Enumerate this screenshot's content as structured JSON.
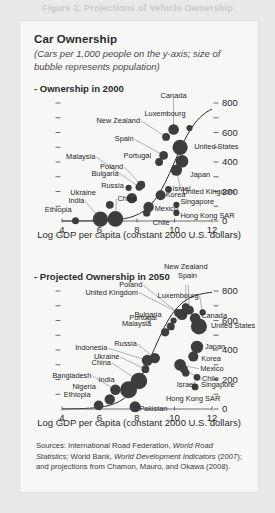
{
  "top_banner": "Figure 2.  Projections of Vehicle Ownership",
  "card": {
    "title": "Car Ownership",
    "subtitle": "(Cars per 1,000 people on the y-axis; size of bubble represents population)"
  },
  "sources": {
    "prefix": "Sources: International Road Federation, ",
    "italic1": "World Road Statistics;",
    "mid": " World Bank, ",
    "italic2": "World Development Indicators",
    "mid2": " (2007); and",
    "line3": "projections from Chamon, Mauro, and Okawa (2008)."
  },
  "chart_data": [
    {
      "type": "scatter",
      "title": "- Ownership in 2000",
      "panel_label": "Ownership in 2000",
      "xlabel": "Log GDP per capita (constant 2000 U.S. dollars)",
      "ylabel": "Cars per 1,000 people",
      "xlim": [
        4,
        12
      ],
      "ylim": [
        0,
        800
      ],
      "xticks": [
        4,
        6,
        8,
        10,
        12
      ],
      "yticks": [
        0,
        200,
        400,
        600,
        800
      ],
      "yticks_minor": [
        100,
        300,
        500,
        700
      ],
      "grid": false,
      "y_axis_side": "right",
      "points": [
        {
          "name": "Ethiopia",
          "x": 4.72,
          "y": 2,
          "pop": 6.5,
          "lx": -4,
          "ly": -11,
          "align": "r"
        },
        {
          "name": "India",
          "x": 6.05,
          "y": 12,
          "pop": 30,
          "lx": -16,
          "ly": -18,
          "align": "r"
        },
        {
          "name": "China",
          "x": 6.85,
          "y": 14,
          "pop": 32,
          "lx": 2,
          "ly": -20,
          "align": "l"
        },
        {
          "name": "Ukraine",
          "x": 6.55,
          "y": 110,
          "pop": 8,
          "lx": -14,
          "ly": -12,
          "align": "r"
        },
        {
          "name": "Bulgaria",
          "x": 7.55,
          "y": 225,
          "pop": 5,
          "lx": -10,
          "ly": -14,
          "align": "r"
        },
        {
          "name": "Russia",
          "x": 7.72,
          "y": 155,
          "pop": 14,
          "lx": -8,
          "ly": -12,
          "align": "r"
        },
        {
          "name": "Malaysia",
          "x": 8.12,
          "y": 230,
          "pop": 7,
          "lx": -44,
          "ly": -30,
          "align": "r"
        },
        {
          "name": "Poland",
          "x": 8.22,
          "y": 245,
          "pop": 9,
          "lx": -18,
          "ly": -18,
          "align": "r"
        },
        {
          "name": "Mexico",
          "x": 8.62,
          "y": 95,
          "pop": 14,
          "lx": 6,
          "ly": 2,
          "align": "l"
        },
        {
          "name": "Chile",
          "x": 8.52,
          "y": 55,
          "pop": 7,
          "lx": 6,
          "ly": 10,
          "align": "l"
        },
        {
          "name": "Korea",
          "x": 9.26,
          "y": 175,
          "pop": 13,
          "lx": 5,
          "ly": 0,
          "align": "l"
        },
        {
          "name": "Israel",
          "x": 9.68,
          "y": 215,
          "pop": 6,
          "lx": 4,
          "ly": 0,
          "align": "l"
        },
        {
          "name": "Singapore",
          "x": 10.1,
          "y": 110,
          "pop": 5,
          "lx": 4,
          "ly": -3,
          "align": "l"
        },
        {
          "name": "Hong Kong SAR",
          "x": 10.1,
          "y": 55,
          "pop": 5,
          "lx": 4,
          "ly": 3,
          "align": "l"
        },
        {
          "name": "Portugal",
          "x": 9.18,
          "y": 400,
          "pop": 8,
          "lx": -8,
          "ly": -6,
          "align": "r"
        },
        {
          "name": "Spain",
          "x": 9.42,
          "y": 445,
          "pop": 10,
          "lx": -30,
          "ly": -16,
          "align": "r"
        },
        {
          "name": "New Zealand",
          "x": 9.55,
          "y": 570,
          "pop": 8,
          "lx": -26,
          "ly": -16,
          "align": "r"
        },
        {
          "name": "Canada",
          "x": 9.95,
          "y": 620,
          "pop": 15,
          "lx": 0,
          "ly": -34,
          "align": "c"
        },
        {
          "name": "Luxembourg",
          "x": 10.8,
          "y": 630,
          "pop": 5,
          "lx": -4,
          "ly": -14,
          "align": "r"
        },
        {
          "name": "United States",
          "x": 10.3,
          "y": 500,
          "pop": 30,
          "lx": 14,
          "ly": 0,
          "align": "l"
        },
        {
          "name": "Japan",
          "x": 10.4,
          "y": 405,
          "pop": 21,
          "lx": 8,
          "ly": 14,
          "align": "l"
        },
        {
          "name": "United Kingdom",
          "x": 10.1,
          "y": 345,
          "pop": 17,
          "lx": 6,
          "ly": 22,
          "align": "l"
        }
      ]
    },
    {
      "type": "scatter",
      "title": "- Projected Ownership in 2050",
      "panel_label": "Projected Ownership in 2050",
      "xlabel": "Log GDP per capita (constant 2000 U.S. dollars)",
      "ylabel": "Cars per 1,000 people",
      "xlim": [
        4,
        12
      ],
      "ylim": [
        0,
        800
      ],
      "xticks": [
        4,
        6,
        8,
        10,
        12
      ],
      "yticks": [
        0,
        200,
        400,
        600,
        800
      ],
      "yticks_minor": [
        100,
        300,
        500,
        700
      ],
      "grid": false,
      "y_axis_side": "right",
      "points": [
        {
          "name": "Ethiopia",
          "x": 5.95,
          "y": 25,
          "pop": 12,
          "lx": -8,
          "ly": -10,
          "align": "r"
        },
        {
          "name": "Nigeria",
          "x": 6.55,
          "y": 65,
          "pop": 14,
          "lx": -14,
          "ly": -12,
          "align": "r"
        },
        {
          "name": "Bangladesh",
          "x": 6.85,
          "y": 130,
          "pop": 14,
          "lx": -24,
          "ly": -14,
          "align": "r"
        },
        {
          "name": "India",
          "x": 7.55,
          "y": 130,
          "pop": 38,
          "lx": -14,
          "ly": -10,
          "align": "r"
        },
        {
          "name": "China",
          "x": 8.1,
          "y": 190,
          "pop": 36,
          "lx": -28,
          "ly": -18,
          "align": "r"
        },
        {
          "name": "Pakistan",
          "x": 7.9,
          "y": 15,
          "pop": 16,
          "lx": 4,
          "ly": 2,
          "align": "l"
        },
        {
          "name": "Ukraine",
          "x": 8.45,
          "y": 270,
          "pop": 8,
          "lx": -26,
          "ly": -12,
          "align": "r"
        },
        {
          "name": "Indonesia",
          "x": 8.55,
          "y": 330,
          "pop": 16,
          "lx": -40,
          "ly": -12,
          "align": "r"
        },
        {
          "name": "Russia",
          "x": 8.95,
          "y": 345,
          "pop": 14,
          "lx": -18,
          "ly": -14,
          "align": "r"
        },
        {
          "name": "Malaysia",
          "x": 9.5,
          "y": 520,
          "pop": 9,
          "lx": -14,
          "ly": -8,
          "align": "r"
        },
        {
          "name": "Portugal",
          "x": 9.8,
          "y": 560,
          "pop": 8,
          "lx": -14,
          "ly": -8,
          "align": "r"
        },
        {
          "name": "Bulgaria",
          "x": 9.95,
          "y": 600,
          "pop": 5,
          "lx": -12,
          "ly": -6,
          "align": "r"
        },
        {
          "name": "United Kingdom",
          "x": 10.4,
          "y": 640,
          "pop": 16,
          "lx": -44,
          "ly": -22,
          "align": "r"
        },
        {
          "name": "Poland",
          "x": 10.2,
          "y": 650,
          "pop": 9,
          "lx": -36,
          "ly": -28,
          "align": "r"
        },
        {
          "name": "New Zealand",
          "x": 10.6,
          "y": 690,
          "pop": 8,
          "lx": 0,
          "ly": -40,
          "align": "c"
        },
        {
          "name": "Spain",
          "x": 10.8,
          "y": 670,
          "pop": 10,
          "lx": -2,
          "ly": -34,
          "align": "c"
        },
        {
          "name": "Luxembourg",
          "x": 11.5,
          "y": 655,
          "pop": 5,
          "lx": -4,
          "ly": -16,
          "align": "r"
        },
        {
          "name": "Canada",
          "x": 11.1,
          "y": 615,
          "pop": 15,
          "lx": 6,
          "ly": -2,
          "align": "l"
        },
        {
          "name": "United States",
          "x": 11.3,
          "y": 560,
          "pop": 34,
          "lx": 12,
          "ly": 0,
          "align": "l"
        },
        {
          "name": "Japan",
          "x": 11.2,
          "y": 420,
          "pop": 20,
          "lx": 8,
          "ly": 0,
          "align": "l"
        },
        {
          "name": "Korea",
          "x": 11.0,
          "y": 355,
          "pop": 13,
          "lx": 8,
          "ly": 2,
          "align": "l"
        },
        {
          "name": "Mexico",
          "x": 10.3,
          "y": 300,
          "pop": 18,
          "lx": 20,
          "ly": 4,
          "align": "l"
        },
        {
          "name": "Chile",
          "x": 10.5,
          "y": 270,
          "pop": 8,
          "lx": 18,
          "ly": 10,
          "align": "l"
        },
        {
          "name": "Israel",
          "x": 10.6,
          "y": 245,
          "pop": 7,
          "lx": 0,
          "ly": 12,
          "align": "c"
        },
        {
          "name": "Singapore",
          "x": 11.2,
          "y": 215,
          "pop": 6,
          "lx": 4,
          "ly": 8,
          "align": "l"
        },
        {
          "name": "Hong Kong SAR",
          "x": 11.1,
          "y": 150,
          "pop": 6,
          "lx": -2,
          "ly": 12,
          "align": "c"
        }
      ]
    }
  ]
}
